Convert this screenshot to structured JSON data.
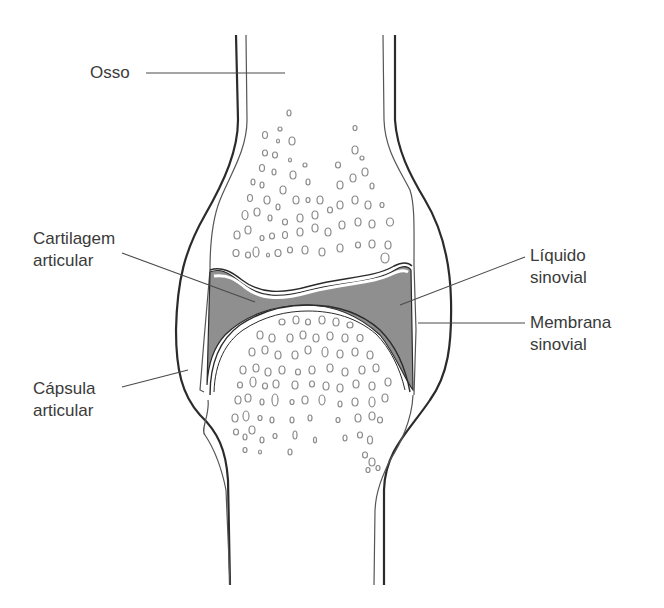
{
  "colors": {
    "outline": "#2b2b2b",
    "thin_outline": "#555555",
    "synovial_fluid": "#8f8f8f",
    "pore": "#8a8a8a",
    "leader": "#4a4a4a",
    "text": "#3a3a3a"
  },
  "labels": [
    {
      "id": "osso",
      "text": "Osso"
    },
    {
      "id": "cartilagem",
      "text": "Cartilagem\narticular"
    },
    {
      "id": "liquido",
      "text": "Líquido\nsinovial"
    },
    {
      "id": "membrana",
      "text": "Membrana\nsinovial"
    },
    {
      "id": "capsula",
      "text": "Cápsula\narticular"
    }
  ]
}
